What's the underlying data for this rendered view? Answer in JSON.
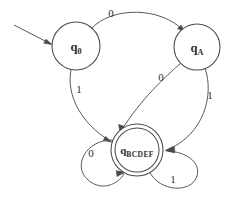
{
  "diagram": {
    "kind": "finite-state-machine",
    "title": "",
    "background_color": "#ffffff",
    "stroke_color": "#4a4a4a",
    "text_color": "#2e2e2e",
    "start_arrow": {
      "name": "start-arrow",
      "label": "",
      "target": "q0"
    },
    "states": [
      {
        "id": "q0",
        "name": "state-q0",
        "label_main": "q",
        "label_sub": "0",
        "accepting": false,
        "cx": 76,
        "cy": 46,
        "r": 24
      },
      {
        "id": "qA",
        "name": "state-qA",
        "label_main": "q",
        "label_sub": "A",
        "accepting": false,
        "cx": 197,
        "cy": 47,
        "r": 23
      },
      {
        "id": "qBCDEF",
        "name": "state-qBCDEF",
        "label_main": "q",
        "label_sub": "BCDEF",
        "accepting": true,
        "cx": 137,
        "cy": 150,
        "r": 26,
        "r_inner": 22
      }
    ],
    "transitions": [
      {
        "id": "t-q0-qA-0",
        "name": "transition-q0-to-qA",
        "from": "q0",
        "to": "qA",
        "symbol": "0",
        "label_x": 111,
        "label_y": 14
      },
      {
        "id": "t-q0-acc-1",
        "name": "transition-q0-to-qBCDEF",
        "from": "q0",
        "to": "qBCDEF",
        "symbol": "1",
        "label_x": 79,
        "label_y": 90
      },
      {
        "id": "t-qA-acc-0",
        "name": "transition-qA-to-qBCDEF",
        "from": "qA",
        "to": "qBCDEF",
        "symbol": "0",
        "label_x": 161,
        "label_y": 78
      },
      {
        "id": "t-qA-acc-1",
        "name": "transition-qA-to-qBCDEF-alt",
        "from": "qA",
        "to": "qBCDEF",
        "symbol": "1",
        "label_x": 210,
        "label_y": 96
      },
      {
        "id": "t-acc-acc-0",
        "name": "transition-qBCDEF-self-left",
        "from": "qBCDEF",
        "to": "qBCDEF",
        "symbol": "0",
        "label_x": 91,
        "label_y": 154
      },
      {
        "id": "t-acc-acc-1",
        "name": "transition-qBCDEF-self-right",
        "from": "qBCDEF",
        "to": "qBCDEF",
        "symbol": "1",
        "label_x": 173,
        "label_y": 180
      }
    ]
  }
}
